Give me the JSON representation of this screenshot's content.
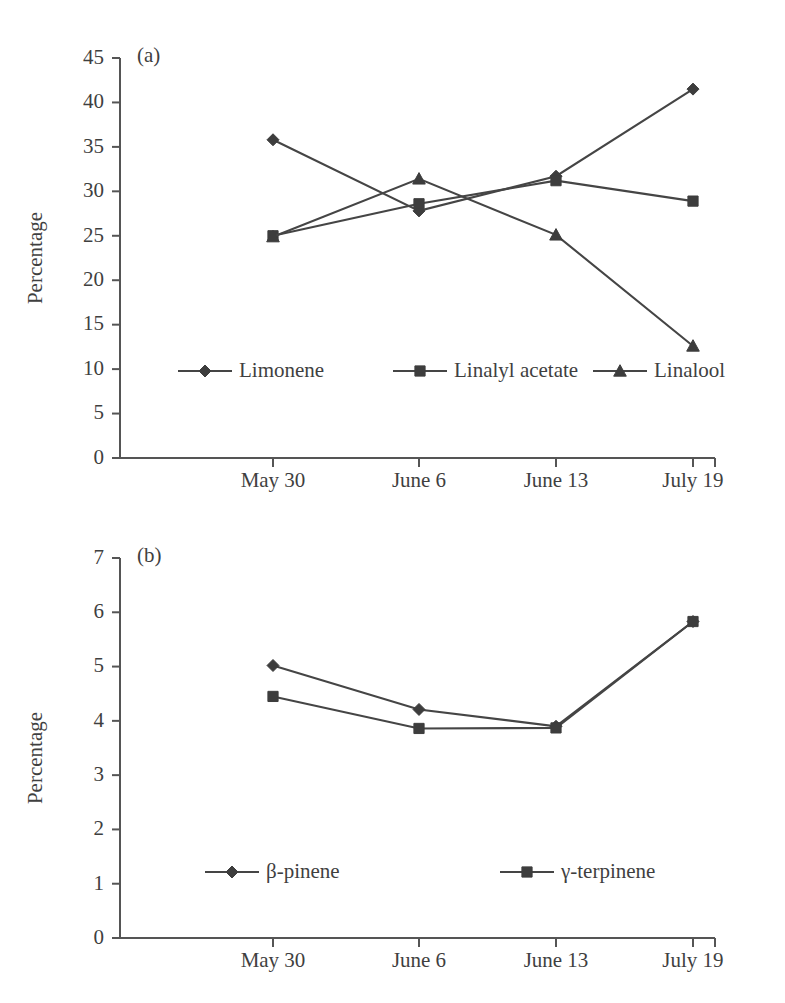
{
  "figure": {
    "background": "#ffffff",
    "ink_color": "#3f3f3f",
    "line_color": "#454545",
    "marker_color": "#3d3d3d",
    "axis_color": "#555555"
  },
  "panels": [
    {
      "id": "a",
      "label": "(a)",
      "ylabel": "Percentage"
    },
    {
      "id": "b",
      "label": "(b)",
      "ylabel": "Percentage"
    }
  ],
  "chart_data": [
    {
      "type": "line",
      "title": "(a)",
      "xlabel": "",
      "ylabel": "Percentage",
      "categories": [
        "May 30",
        "June 6",
        "June 13",
        "July 19"
      ],
      "x": [
        "May 30",
        "June 6",
        "June 13",
        "July 19"
      ],
      "ylim": [
        0,
        45
      ],
      "yticks": [
        0,
        5,
        10,
        15,
        20,
        25,
        30,
        35,
        40,
        45
      ],
      "ytick_labels": [
        "0",
        "5",
        "10",
        "15",
        "20",
        "25",
        "30",
        "35",
        "40",
        "45"
      ],
      "xtick_labels": [
        "May 30",
        "June 6",
        "June 13",
        "July 19"
      ],
      "grid": false,
      "legend_position": "inside-lower-left",
      "series": [
        {
          "name": "Limonene",
          "marker": "diamond",
          "values": [
            35.8,
            27.8,
            31.7,
            41.5
          ]
        },
        {
          "name": "Linalyl acetate",
          "marker": "square",
          "values": [
            25.0,
            28.6,
            31.2,
            28.9
          ]
        },
        {
          "name": "Linalool",
          "marker": "triangle",
          "values": [
            24.9,
            31.4,
            25.1,
            12.6
          ]
        }
      ]
    },
    {
      "type": "line",
      "title": "(b)",
      "xlabel": "",
      "ylabel": "Percentage",
      "categories": [
        "May 30",
        "June 6",
        "June 13",
        "July 19"
      ],
      "x": [
        "May 30",
        "June 6",
        "June 13",
        "July 19"
      ],
      "ylim": [
        0,
        7
      ],
      "yticks": [
        0,
        1,
        2,
        3,
        4,
        5,
        6,
        7
      ],
      "ytick_labels": [
        "0",
        "1",
        "2",
        "3",
        "4",
        "5",
        "6",
        "7"
      ],
      "xtick_labels": [
        "May 30",
        "June 6",
        "June 13",
        "July 19"
      ],
      "grid": false,
      "legend_position": "inside-lower-left",
      "series": [
        {
          "name": "β-pinene",
          "marker": "diamond",
          "values": [
            5.02,
            4.21,
            3.9,
            5.83
          ]
        },
        {
          "name": "γ-terpinene",
          "marker": "square",
          "values": [
            4.45,
            3.86,
            3.87,
            5.83
          ]
        }
      ]
    }
  ]
}
